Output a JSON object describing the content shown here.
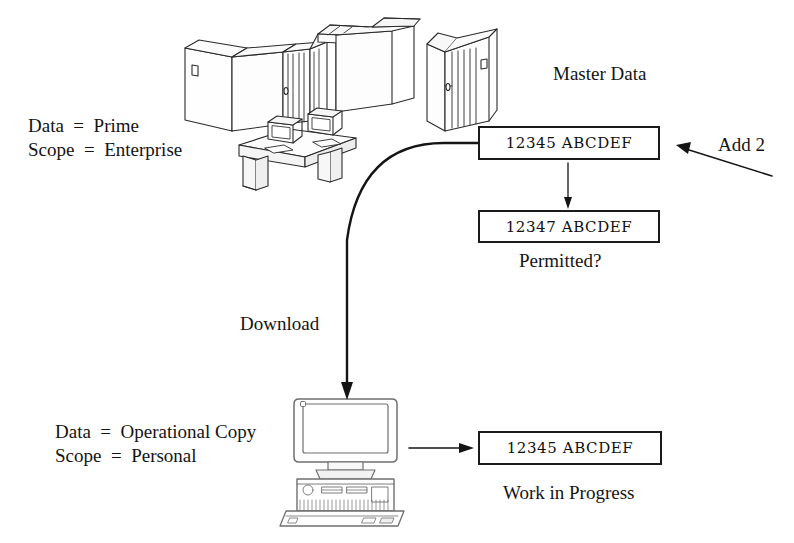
{
  "diagram": {
    "title_labels": {
      "master_data": "Master Data",
      "permitted": "Permitted?",
      "work_in_progress": "Work in Progress",
      "download": "Download",
      "add_2": "Add 2"
    },
    "enterprise_annotation": {
      "line1": "Data  =  Prime",
      "line2": "Scope  =  Enterprise",
      "data_value": "Prime",
      "scope_value": "Enterprise"
    },
    "personal_annotation": {
      "line1": "Data  =  Operational Copy",
      "line2": "Scope  =  Personal",
      "data_value": "Operational Copy",
      "scope_value": "Personal"
    },
    "records": {
      "master": "12345 ABCDEF",
      "master_after_add": "12347 ABCDEF",
      "work_in_progress": "12345 ABCDEF"
    },
    "icons": {
      "mainframe": "mainframe-computer-icon",
      "disk_cabinet": "disk-cabinet-icon",
      "operator_desk": "operator-desk-icon",
      "terminal_left": "terminal-icon",
      "terminal_right": "terminal-icon",
      "personal_computer": "desktop-pc-icon",
      "download_arrow": "curved-arrow-icon",
      "update_arrow": "down-arrow-icon",
      "add_arrow": "diagonal-arrow-icon",
      "copy_arrow": "right-arrow-icon"
    },
    "colors": {
      "ink": "#111111",
      "line": "#1a1a1a",
      "paper": "#ffffff",
      "shade": "#8d8d8d"
    }
  }
}
